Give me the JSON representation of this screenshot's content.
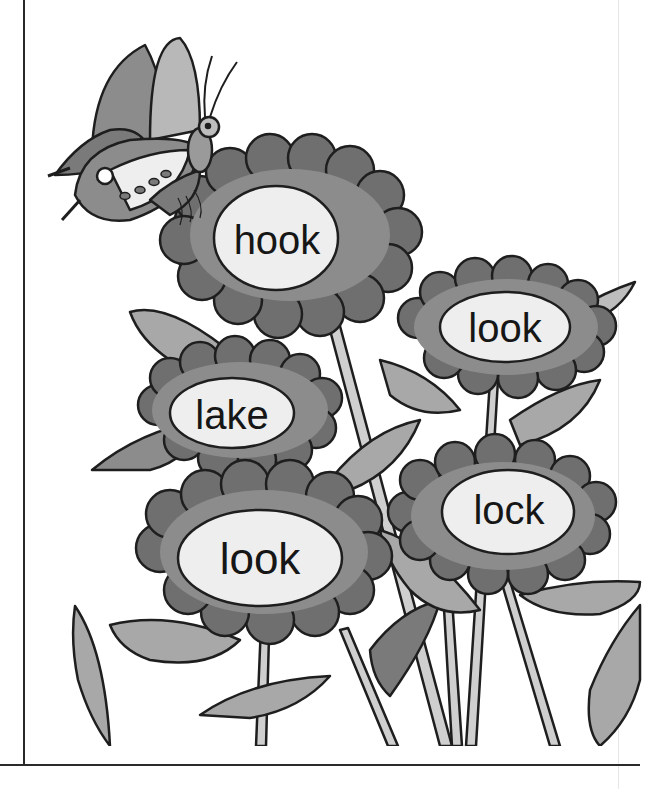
{
  "worksheet": {
    "illustration": "butterfly-and-flowers",
    "flowers": [
      {
        "id": "flower-top",
        "word": "hook"
      },
      {
        "id": "flower-right-upper",
        "word": "look"
      },
      {
        "id": "flower-left-middle",
        "word": "lake"
      },
      {
        "id": "flower-bottom-left",
        "word": "look"
      },
      {
        "id": "flower-right-lower",
        "word": "lock"
      }
    ]
  },
  "colors": {
    "petal_dark": "#6f6f6f",
    "petal_light": "#8c8c8c",
    "leaf": "#a8a8a8",
    "leaf_dark": "#7a7a7a",
    "stem": "#cfcfcf",
    "outline": "#1e1e1e",
    "center": "#eeeeee",
    "border": "#2a2a2a"
  }
}
